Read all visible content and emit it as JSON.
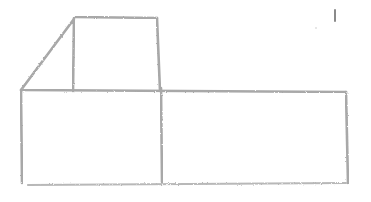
{
  "image": {
    "kind": "pencil-sketch",
    "subject": "hand-drawn box shapes: a small square with a diagonal slanted roof line atop a wide rectangle split into two compartments",
    "stroke_color": "#a8a8a8",
    "background_color": "#ffffff",
    "elements": [
      "upper-square",
      "diagonal-line",
      "lower-rectangle",
      "rectangle-divider",
      "stray-mark"
    ]
  }
}
